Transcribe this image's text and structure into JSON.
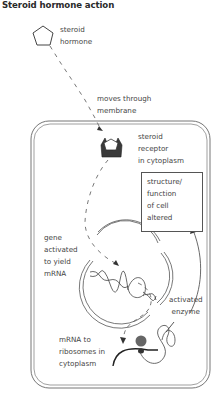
{
  "title": "Steroid hormone action",
  "labels": {
    "steroid_hormone": "steroid\nhormone",
    "moves_through_membrane": "moves through\nmembrane",
    "steroid_receptor": "steroid\nreceptor\nin cytoplasm",
    "structure_function": "structure/\nfunction\nof cell\naltered",
    "gene_activated": "gene\nactivated\nto yield\nmRNA",
    "activated_enzyme": "activated\nenzyme",
    "mrna_ribosomes": "mRNA to\nribosomes in\ncytoplasm"
  },
  "icons": {
    "hormone": "pentagon-icon",
    "receptor": "receptor-icon",
    "ribosome": "ribosome-icon",
    "dna": "dna-helix-icon",
    "enzyme": "enzyme-coil-icon"
  },
  "colors": {
    "line": "#444444",
    "receptor_fill": "#3a3a3a",
    "ribosome_fill": "#666666"
  }
}
